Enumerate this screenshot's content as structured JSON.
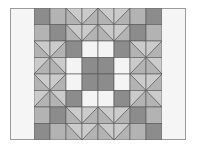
{
  "image": {
    "description": "Quilt block pattern with zigzag borders and central dark square",
    "colors": {
      "dark": "#8c8c8c",
      "medium": "#b3b3b3",
      "light": "#cbcbcb",
      "white": "#f4f4f4",
      "line": "#555555",
      "background": "#f5f5f5"
    },
    "grid": {
      "cols": 8,
      "rows": 8,
      "cell_w": 16,
      "cell_h": 16.5
    }
  }
}
